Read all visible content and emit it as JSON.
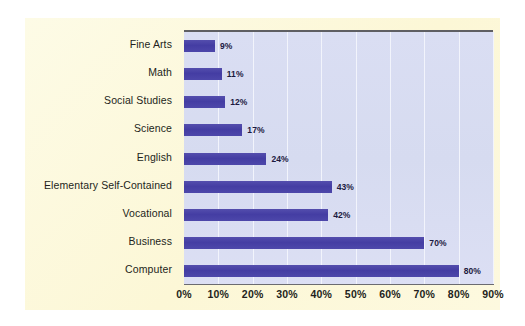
{
  "chart_data": {
    "type": "bar",
    "orientation": "horizontal",
    "title": "",
    "subtitle": "",
    "xlabel": "",
    "ylabel": "",
    "categories": [
      "Fine Arts",
      "Math",
      "Social Studies",
      "Science",
      "English",
      "Elementary Self-Contained",
      "Vocational",
      "Business",
      "Computer"
    ],
    "values": [
      9,
      11,
      12,
      17,
      24,
      43,
      42,
      70,
      80
    ],
    "value_labels": [
      "9%",
      "11%",
      "12%",
      "17%",
      "24%",
      "43%",
      "42%",
      "70%",
      "80%"
    ],
    "xlim": [
      0,
      90
    ],
    "xticks": [
      0,
      10,
      20,
      30,
      40,
      50,
      60,
      70,
      80,
      90
    ],
    "xtick_labels": [
      "0%",
      "10%",
      "20%",
      "30%",
      "40%",
      "50%",
      "60%",
      "70%",
      "80%",
      "90%"
    ],
    "grid": true,
    "grid_axis": "x",
    "legend": null,
    "colors": {
      "bar": "#4a44a8",
      "plot_background": "#d9ddf2",
      "panel_background": "#fdf8da",
      "gridline": "#f2f4fc",
      "axis_line": "#5f5f63",
      "label_text": "#231f20",
      "value_text": "#1c1a40"
    }
  }
}
